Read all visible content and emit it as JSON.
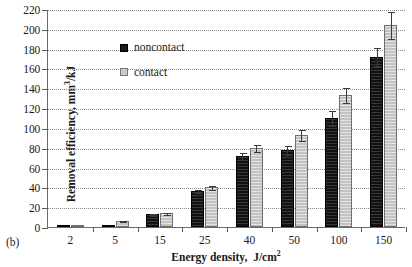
{
  "panel_label": "(b)",
  "axes": {
    "y_title_main": "Removal efficiency,",
    "y_title_units_base": "mm",
    "y_title_units_sup": "3",
    "y_title_units_tail": "/kJ",
    "x_title_main": "Energy density,",
    "x_title_units_base": "J/cm",
    "x_title_units_sup": "2",
    "y_ticks": [
      0,
      20,
      40,
      60,
      80,
      100,
      120,
      140,
      160,
      180,
      200,
      220
    ],
    "ylim": [
      0,
      220
    ],
    "grid": true
  },
  "legend": {
    "position": "upper-left-inside",
    "entries": [
      {
        "label": "noncontact",
        "color": "#121212"
      },
      {
        "label": "contact",
        "color": "#c2c2c2"
      }
    ]
  },
  "colors": {
    "noncontact": "#121212",
    "contact": "#c2c2c2",
    "axis": "#6b6b6b",
    "grid": "#8a8a8a",
    "error": "#3a3a3a",
    "background": "#ffffff"
  },
  "chart_data": {
    "type": "bar",
    "title": "",
    "xlabel": "Energy density, J/cm2",
    "ylabel": "Removal efficiency, mm3/kJ",
    "ylim": [
      0,
      220
    ],
    "ytick_step": 20,
    "grid": true,
    "legend_position": "upper left",
    "categories": [
      "2",
      "5",
      "15",
      "25",
      "40",
      "50",
      "100",
      "150"
    ],
    "series": [
      {
        "name": "noncontact",
        "values": [
          0.5,
          1.5,
          13,
          36,
          72,
          78,
          110,
          172
        ],
        "errors": [
          0.5,
          0.8,
          1.5,
          2,
          4,
          5,
          8,
          10
        ]
      },
      {
        "name": "contact",
        "values": [
          0.5,
          6,
          14,
          40,
          80,
          93,
          133,
          204
        ],
        "errors": [
          0.5,
          1,
          1.5,
          2.5,
          4,
          6,
          8,
          14
        ]
      }
    ]
  }
}
